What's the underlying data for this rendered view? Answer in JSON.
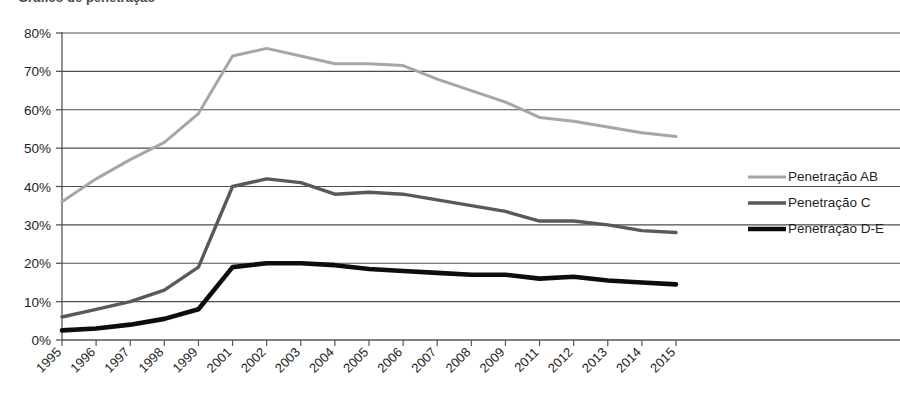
{
  "chart_data": {
    "type": "line",
    "title": "",
    "xlabel": "",
    "ylabel": "",
    "ylim": [
      0,
      80
    ],
    "ytick_values": [
      0,
      10,
      20,
      30,
      40,
      50,
      60,
      70,
      80
    ],
    "ytick_labels": [
      "0%",
      "10%",
      "20%",
      "30%",
      "40%",
      "50%",
      "60%",
      "70%",
      "80%"
    ],
    "grid": true,
    "legend_position": "right",
    "categories": [
      "1995",
      "1996",
      "1997",
      "1998",
      "1999",
      "2001",
      "2002",
      "2003",
      "2004",
      "2005",
      "2006",
      "2007",
      "2008",
      "2009",
      "2011",
      "2012",
      "2013",
      "2014",
      "2015"
    ],
    "series": [
      {
        "name": "Penetração AB",
        "color": "#a6a6a6",
        "values": [
          36,
          42,
          47,
          51.5,
          59,
          74,
          76,
          74,
          72,
          72,
          71.5,
          68,
          65,
          62,
          58,
          57,
          55.5,
          54,
          53
        ]
      },
      {
        "name": "Penetração C",
        "color": "#595959",
        "values": [
          6,
          8,
          10,
          13,
          19,
          40,
          42,
          41,
          38,
          38.5,
          38,
          36.5,
          35,
          33.5,
          31,
          31,
          30,
          28.5,
          28
        ]
      },
      {
        "name": "Penetração D-E",
        "color": "#0d0d0d",
        "values": [
          2.5,
          3,
          4,
          5.5,
          8,
          19,
          20,
          20,
          19.5,
          18.5,
          18,
          17.5,
          17,
          17,
          16,
          16.5,
          15.5,
          15,
          14.5
        ]
      }
    ]
  },
  "legend": {
    "items": [
      {
        "label": "Penetração AB",
        "color": "#a6a6a6",
        "thickness": 3
      },
      {
        "label": "Penetração C",
        "color": "#595959",
        "thickness": 3.4
      },
      {
        "label": "Penetração D-E",
        "color": "#0d0d0d",
        "thickness": 4.6
      }
    ]
  },
  "axis": {
    "y_labels": [
      "80%",
      "70%",
      "60%",
      "50%",
      "40%",
      "30%",
      "20%",
      "10%",
      "0%"
    ],
    "x_labels": [
      "1995",
      "1996",
      "1997",
      "1998",
      "1999",
      "2001",
      "2002",
      "2003",
      "2004",
      "2005",
      "2006",
      "2007",
      "2008",
      "2009",
      "2011",
      "2012",
      "2013",
      "2014",
      "2015"
    ]
  },
  "colors": {
    "series_ab": "#a6a6a6",
    "series_c": "#595959",
    "series_de": "#0d0d0d",
    "gridline": "#4d4d4d",
    "axis": "#555555",
    "text": "#1f1f1f",
    "background": "#ffffff"
  },
  "artifacts": {
    "cropped_header_text": "Gráfico de penetração"
  }
}
